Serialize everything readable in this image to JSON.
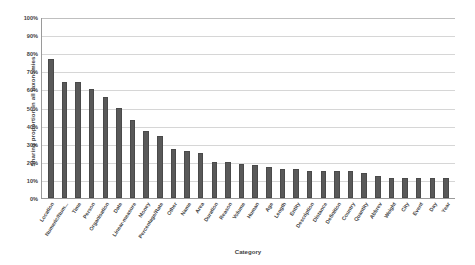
{
  "chart_data": {
    "type": "bar",
    "title": "",
    "xlabel": "Category",
    "ylabel": "Sharing proportion in all taxonomies",
    "ylim": [
      0,
      100
    ],
    "grid": true,
    "legend": false,
    "ytick_labels": [
      "100%",
      "90%",
      "80%",
      "70%",
      "60%",
      "50%",
      "40%",
      "30%",
      "20%",
      "10%",
      "0%"
    ],
    "ytick_values": [
      100,
      90,
      80,
      70,
      60,
      50,
      40,
      30,
      20,
      10,
      0
    ],
    "categories": [
      "Location",
      "Numeric/Num...",
      "Time",
      "Person",
      "Organisation",
      "Date",
      "Linear-measure",
      "Money",
      "Percentage/Rate",
      "Other",
      "Name",
      "Area",
      "Duration",
      "Reason",
      "Volume",
      "Human",
      "Age",
      "Length",
      "Entity",
      "Description",
      "Distance",
      "Definition",
      "Country",
      "Quantity",
      "Abbrev",
      "Weight",
      "City",
      "Event",
      "Day",
      "Year"
    ],
    "values": [
      77,
      64,
      64,
      60,
      56,
      50,
      43,
      37,
      34,
      27,
      26,
      25,
      20,
      20,
      19,
      18,
      17,
      16,
      16,
      15,
      15,
      15,
      15,
      14,
      12,
      11,
      11,
      11,
      11,
      11
    ]
  }
}
